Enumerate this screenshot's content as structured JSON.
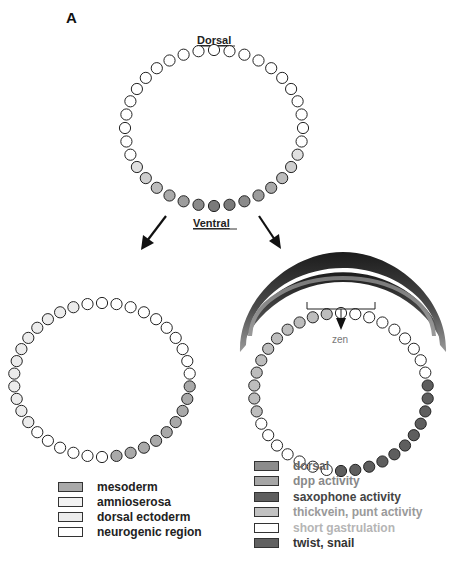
{
  "panel": {
    "label": "A"
  },
  "labels": {
    "dorsal": "Dorsal",
    "ventral": "Ventral",
    "zen": "zen"
  },
  "colors": {
    "outline": "#222222",
    "white_cell": "#ffffff",
    "light_cell": "#ececec",
    "mesoderm": "#a9a9a9",
    "dpp": "#bdbdbd",
    "twist_snail": "#5e5e5e",
    "arc_dark": "#2a2a2a",
    "arc_grey": "#8a8a8a"
  },
  "embryos": [
    {
      "id": "wild-type-initial",
      "cx": 214,
      "cy": 128,
      "rx": 89,
      "ry": 78,
      "cell_r": 5.6,
      "count": 36,
      "cells": [
        "#ffffff",
        "#ffffff",
        "#ffffff",
        "#ffffff",
        "#ffffff",
        "#ffffff",
        "#ffffff",
        "#ffffff",
        "#ffffff",
        "#ffffff",
        "#ffffff",
        "#e0e0e0",
        "#cfcfcf",
        "#bdbdbd",
        "#aaaaaa",
        "#9c9c9c",
        "#8a8a8a",
        "#7a7a7a",
        "#7a7a7a",
        "#8a8a8a",
        "#9c9c9c",
        "#aaaaaa",
        "#bdbdbd",
        "#cfcfcf",
        "#e0e0e0",
        "#ffffff",
        "#ffffff",
        "#ffffff",
        "#ffffff",
        "#ffffff",
        "#ffffff",
        "#ffffff",
        "#ffffff",
        "#ffffff",
        "#ffffff",
        "#ffffff"
      ]
    },
    {
      "id": "fate-map",
      "cx": 102,
      "cy": 380,
      "rx": 88,
      "ry": 77,
      "cell_r": 5.6,
      "count": 38,
      "cells": [
        "#ffffff",
        "#ffffff",
        "#ffffff",
        "#ffffff",
        "#ffffff",
        "#ffffff",
        "#ffffff",
        "#ffffff",
        "#ffffff",
        "#ffffff",
        "#a9a9a9",
        "#a9a9a9",
        "#a9a9a9",
        "#a9a9a9",
        "#a9a9a9",
        "#a9a9a9",
        "#a9a9a9",
        "#a9a9a9",
        "#a9a9a9",
        "#ffffff",
        "#ffffff",
        "#ffffff",
        "#ffffff",
        "#ffffff",
        "#ffffff",
        "#ececec",
        "#ececec",
        "#ececec",
        "#ececec",
        "#ececec",
        "#ececec",
        "#ececec",
        "#ececec",
        "#ececec",
        "#ececec",
        "#ececec",
        "#ececec",
        "#ffffff"
      ]
    },
    {
      "id": "gene-activity",
      "cx": 341,
      "cy": 392,
      "rx": 87,
      "ry": 79,
      "cell_r": 5.6,
      "count": 38,
      "cells": [
        "#ffffff",
        "#ffffff",
        "#ffffff",
        "#ffffff",
        "#ffffff",
        "#ffffff",
        "#ffffff",
        "#ffffff",
        "#ffffff",
        "#5e5e5e",
        "#5e5e5e",
        "#5e5e5e",
        "#5e5e5e",
        "#5e5e5e",
        "#5e5e5e",
        "#5e5e5e",
        "#5e5e5e",
        "#5e5e5e",
        "#5e5e5e",
        "#5e5e5e",
        "#ffffff",
        "#ffffff",
        "#ffffff",
        "#ffffff",
        "#ffffff",
        "#ffffff",
        "#ffffff",
        "#bdbdbd",
        "#bdbdbd",
        "#bdbdbd",
        "#bdbdbd",
        "#bdbdbd",
        "#bdbdbd",
        "#bdbdbd",
        "#bdbdbd",
        "#bdbdbd",
        "#bdbdbd",
        "#bdbdbd"
      ]
    }
  ],
  "legend_left": [
    {
      "label": "mesoderm",
      "color": "#a9a9a9",
      "text_color": "#222222"
    },
    {
      "label": "amnioserosa",
      "color": "#f2f2f2",
      "text_color": "#222222"
    },
    {
      "label": "dorsal ectoderm",
      "color": "#ececec",
      "text_color": "#222222"
    },
    {
      "label": "neurogenic region",
      "color": "#ffffff",
      "text_color": "#222222"
    }
  ],
  "legend_right": [
    {
      "label": "dorsal",
      "color": "#8c8c8c",
      "text_color": "#666666"
    },
    {
      "label": "dpp activity",
      "color": "#a6a6a6",
      "text_color": "#888888"
    },
    {
      "label": "saxophone activity",
      "color": "#5e5e5e",
      "text_color": "#444444"
    },
    {
      "label": "thickvein, punt activity",
      "color": "#c2c2c2",
      "text_color": "#9a9a9a"
    },
    {
      "label": "short gastrulation",
      "color": "#ffffff",
      "text_color": "#b5b5b5"
    },
    {
      "label": "twist, snail",
      "color": "#616161",
      "text_color": "#333333"
    }
  ]
}
